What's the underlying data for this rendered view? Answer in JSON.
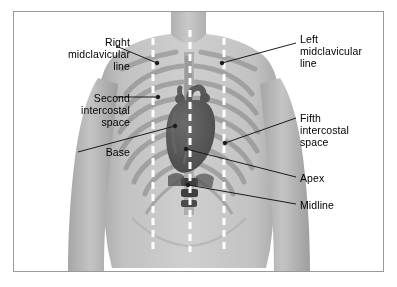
{
  "figure": {
    "type": "anatomical-illustration",
    "border_color": "#9a9a9a",
    "background_color": "#ffffff"
  },
  "colors": {
    "skin": "#b9b9b9",
    "skin_light": "#cfcfcf",
    "bone": "#a2a2a2",
    "heart": "#5a5a5a",
    "heart_dark": "#4a4a4a",
    "dashed_line": "#ffffff",
    "leader_line": "#1a1a1a",
    "text": "#000000"
  },
  "labels": [
    {
      "id": "right-midclavicular-line",
      "text": "Right\nmidclavicular\nline",
      "align": "right",
      "x": 30,
      "y": 36,
      "width": 100
    },
    {
      "id": "second-intercostal-space",
      "text": "Second\nintercostal\nspace",
      "align": "right",
      "x": 30,
      "y": 92,
      "width": 100
    },
    {
      "id": "base",
      "text": "Base",
      "align": "right",
      "x": 30,
      "y": 146,
      "width": 100
    },
    {
      "id": "left-midclavicular-line",
      "text": "Left\nmidclavicular\nline",
      "align": "left",
      "x": 300,
      "y": 33,
      "width": 92
    },
    {
      "id": "fifth-intercostal-space",
      "text": "Fifth\nintercostal\nspace",
      "align": "left",
      "x": 300,
      "y": 112,
      "width": 92
    },
    {
      "id": "apex",
      "text": "Apex",
      "align": "left",
      "x": 300,
      "y": 172,
      "width": 92
    },
    {
      "id": "midline",
      "text": "Midline",
      "align": "left",
      "x": 300,
      "y": 199,
      "width": 92
    }
  ],
  "leader_lines": [
    {
      "id": "leader-right-midclavicular-line",
      "from": [
        116,
        46
      ],
      "to": [
        157,
        63
      ]
    },
    {
      "id": "leader-second-intercostal-space",
      "from": [
        116,
        97
      ],
      "to": [
        158,
        97
      ]
    },
    {
      "id": "leader-base",
      "from": [
        78,
        152
      ],
      "to": [
        175,
        126
      ]
    },
    {
      "id": "leader-left-midclavicular-line",
      "from": [
        296,
        43
      ],
      "to": [
        222,
        63
      ]
    },
    {
      "id": "leader-fifth-intercostal-space",
      "from": [
        296,
        118
      ],
      "to": [
        225,
        143
      ]
    },
    {
      "id": "leader-apex",
      "from": [
        296,
        177
      ],
      "to": [
        186,
        149
      ]
    },
    {
      "id": "leader-midline",
      "from": [
        296,
        204
      ],
      "to": [
        188,
        185
      ]
    }
  ],
  "reference_lines": [
    {
      "id": "right-midclavicular-dashed",
      "x": 153,
      "y_top": 38,
      "y_bottom": 250,
      "style": "dashed",
      "color": "#ffffff"
    },
    {
      "id": "midline-dashed",
      "x": 190,
      "y_top": 30,
      "y_bottom": 252,
      "style": "dashed",
      "color": "#ffffff"
    },
    {
      "id": "left-midclavicular-dashed",
      "x": 224,
      "y_top": 38,
      "y_bottom": 250,
      "style": "dashed",
      "color": "#ffffff"
    }
  ],
  "anatomy": {
    "heart": {
      "name": "heart",
      "apex_point": [
        178,
        170
      ],
      "base_point": [
        196,
        104
      ]
    },
    "ribs_left_count": 7,
    "ribs_right_count": 7,
    "clavicles": 2,
    "sternum": true
  }
}
